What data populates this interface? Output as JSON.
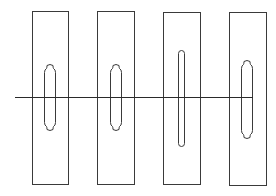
{
  "diagram": {
    "type": "slotted-plates",
    "colors": {
      "stroke": "#3a3a3a",
      "line": "#2a2a2a",
      "background": "#ffffff"
    },
    "plates": [
      {
        "id": 1,
        "x": 32,
        "y": 11,
        "w": 36,
        "h": 173,
        "slot": {
          "shape": "notched",
          "x": 44,
          "y": 64,
          "w": 11,
          "h": 66
        }
      },
      {
        "id": 2,
        "x": 97,
        "y": 11,
        "w": 37,
        "h": 173,
        "slot": {
          "shape": "notched",
          "x": 110,
          "y": 64,
          "w": 11,
          "h": 66
        }
      },
      {
        "id": 3,
        "x": 163,
        "y": 12,
        "w": 37,
        "h": 172,
        "slot": {
          "shape": "rounded",
          "x": 178,
          "y": 50,
          "w": 6,
          "h": 96
        }
      },
      {
        "id": 4,
        "x": 229,
        "y": 12,
        "w": 37,
        "h": 173,
        "slot": {
          "shape": "notched",
          "x": 241,
          "y": 60,
          "w": 11,
          "h": 78
        }
      }
    ],
    "line": {
      "x1": 15,
      "x2": 253,
      "y": 97
    }
  }
}
